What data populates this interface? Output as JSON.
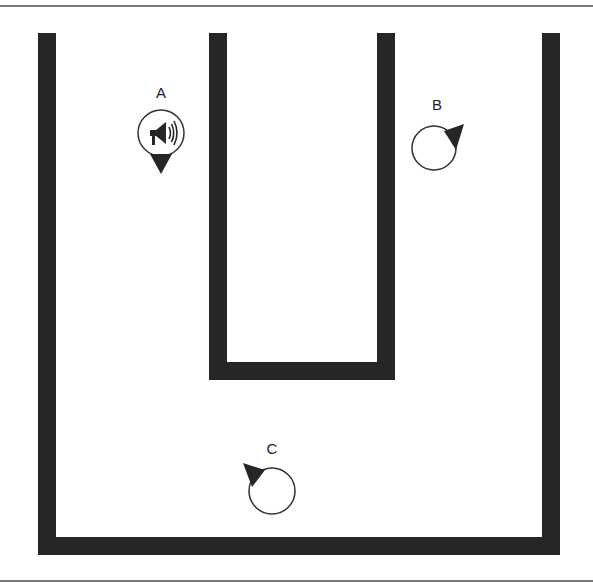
{
  "diagram": {
    "type": "floor-plan",
    "colors": {
      "wall": "#262626",
      "border": "#777777",
      "background": "#ffffff"
    },
    "agents": [
      {
        "id": "A",
        "label": "A",
        "icon": "megaphone-icon",
        "heading": "down"
      },
      {
        "id": "B",
        "label": "B",
        "icon": "none",
        "heading": "up-right"
      },
      {
        "id": "C",
        "label": "C",
        "icon": "none",
        "heading": "up-left"
      }
    ]
  }
}
